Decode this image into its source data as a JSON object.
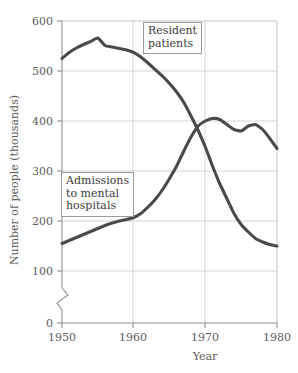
{
  "chart_data": {
    "type": "line",
    "title": "",
    "subtitle": "",
    "xlabel": "Year",
    "ylabel": "Number of people (thousands)",
    "xlim": [
      1950,
      1980
    ],
    "ylim": [
      0,
      600
    ],
    "y_axis_break": true,
    "y_axis_break_between": [
      0,
      100
    ],
    "grid": true,
    "legend_position": "inline-callouts",
    "xticks": [
      1950,
      1960,
      1970,
      1980
    ],
    "xtick_labels": [
      "1950",
      "1960",
      "1970",
      "1980"
    ],
    "yticks": [
      0,
      100,
      200,
      300,
      400,
      500,
      600
    ],
    "ytick_labels": [
      "0",
      "100",
      "200",
      "300",
      "400",
      "500",
      "600"
    ],
    "annotations": [
      {
        "text": "Resident patients",
        "series": "Resident patients"
      },
      {
        "text": "Admissions to mental hospitals",
        "series": "Admissions to mental hospitals"
      }
    ],
    "x": [
      1950,
      1951,
      1952,
      1953,
      1954,
      1955,
      1956,
      1957,
      1958,
      1959,
      1960,
      1961,
      1962,
      1963,
      1964,
      1965,
      1966,
      1967,
      1968,
      1969,
      1970,
      1971,
      1972,
      1973,
      1974,
      1975,
      1976,
      1977,
      1978,
      1979,
      1980
    ],
    "series": [
      {
        "name": "Resident patients",
        "color": "#4a4a4a",
        "values": [
          525,
          537,
          546,
          553,
          559,
          566,
          551,
          548,
          545,
          542,
          537,
          528,
          516,
          503,
          490,
          475,
          458,
          437,
          410,
          381,
          348,
          310,
          275,
          245,
          215,
          193,
          178,
          165,
          158,
          153,
          150
        ]
      },
      {
        "name": "Admissions to mental hospitals",
        "color": "#4a4a4a",
        "values": [
          155,
          161,
          167,
          173,
          179,
          185,
          191,
          196,
          200,
          203,
          207,
          215,
          228,
          243,
          262,
          285,
          310,
          340,
          368,
          390,
          400,
          405,
          403,
          393,
          383,
          380,
          390,
          393,
          383,
          365,
          345
        ]
      }
    ]
  },
  "labels": {
    "resident_line1": "Resident",
    "resident_line2": "patients",
    "admissions_line1": "Admissions",
    "admissions_line2": "to mental",
    "admissions_line3": "hospitals"
  },
  "colors": {
    "line": "#4a4a4a",
    "grid": "#c9c9c9",
    "axis": "#8f8f8f",
    "text": "#5c5c5c",
    "background": "#ffffff"
  }
}
